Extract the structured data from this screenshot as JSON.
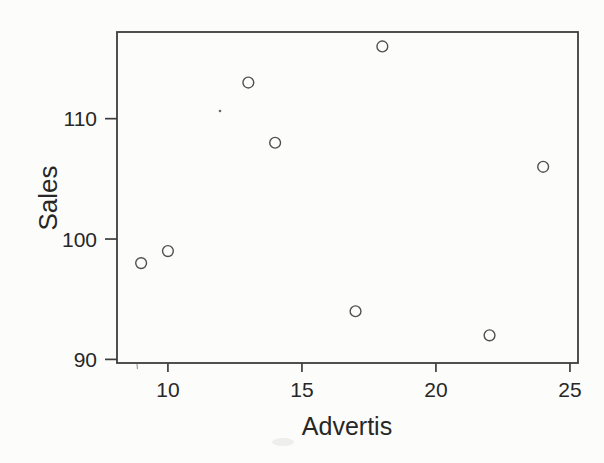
{
  "page": {
    "background": "#fcfcfa"
  },
  "chart_data": {
    "type": "scatter",
    "title": "",
    "xlabel": "Advertis",
    "ylabel": "Sales",
    "points": [
      {
        "x": 9,
        "y": 98
      },
      {
        "x": 10,
        "y": 99
      },
      {
        "x": 13,
        "y": 113
      },
      {
        "x": 14,
        "y": 108
      },
      {
        "x": 17,
        "y": 94
      },
      {
        "x": 18,
        "y": 116
      },
      {
        "x": 22,
        "y": 92
      },
      {
        "x": 24,
        "y": 106
      }
    ],
    "x_ticks": [
      10,
      15,
      20,
      25
    ],
    "y_ticks": [
      90,
      100,
      110
    ],
    "xlim": [
      8.1,
      25.3
    ],
    "ylim": [
      89.7,
      117.2
    ],
    "grid": false,
    "legend": null,
    "marker": "open-circle",
    "colors": {
      "axis": "#3d3d3d",
      "marker_stroke": "#4f4f4f",
      "text": "#272727",
      "background": "#fcfcfa"
    }
  },
  "scan_artifacts": {
    "speck": {
      "px": 220,
      "py": 111
    },
    "partial_tick": {
      "px": 137,
      "py": 364
    },
    "smudge": {
      "px": 283,
      "py": 442
    }
  }
}
